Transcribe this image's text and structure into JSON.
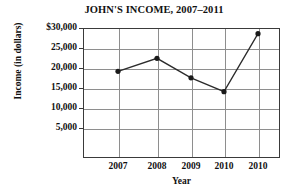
{
  "chart_data": {
    "type": "line",
    "title": "JOHN'S INCOME, 2007–2011",
    "xlabel": "Year",
    "ylabel": "Income (in dollars)",
    "categories": [
      "2007",
      "2008",
      "2009",
      "2010",
      "2010"
    ],
    "values": [
      20000,
      23000,
      18500,
      15300,
      28700
    ],
    "series": [
      {
        "name": "Income",
        "values": [
          20000,
          23000,
          18500,
          15300,
          28700
        ]
      }
    ],
    "ylim": [
      0,
      30000
    ],
    "yticks": [
      5000,
      10000,
      15000,
      20000,
      25000,
      30000
    ],
    "ytick_labels": [
      "5,000",
      "10,000",
      "15,000",
      "20,000",
      "25,000",
      "$30,000"
    ],
    "grid": true,
    "legend": "none",
    "marker": "filled-circle",
    "line_color": "#2b2b2b",
    "marker_color": "#1a1a1a",
    "grid_color": "#8e8e8e",
    "axis_color": "#3a3a3a",
    "text_color": "#111111",
    "background": "#ffffff"
  }
}
